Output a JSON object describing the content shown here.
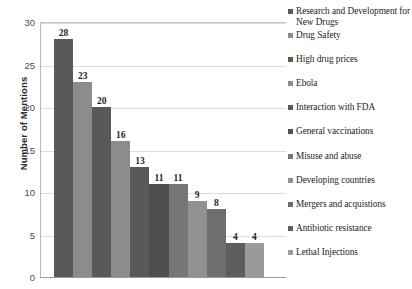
{
  "chart_data": {
    "type": "bar",
    "title": "",
    "xlabel": "",
    "ylabel": "Number of Mentions",
    "ylim": [
      0,
      30
    ],
    "ytick_labels": [
      "30",
      "25",
      "20",
      "15",
      "10",
      "5",
      "0"
    ],
    "ytick_values": [
      30,
      25,
      20,
      15,
      10,
      5,
      0
    ],
    "grid": true,
    "legend_position": "right",
    "categories": [
      "Research and Development for New Drugs",
      "Drug Safety",
      "High drug prices",
      "Ebola",
      "Interaction with FDA",
      "General vaccinations",
      "Misuse and abuse",
      "Developing countries",
      "Mergers and acquistions",
      "Antibiotic resistance",
      "Lethal Injections"
    ],
    "values": [
      28,
      23,
      20,
      16,
      13,
      11,
      11,
      9,
      8,
      4,
      4
    ],
    "data_labels": [
      "28",
      "23",
      "20",
      "16",
      "13",
      "11",
      "11",
      "9",
      "8",
      "4",
      "4"
    ],
    "colors": [
      "#595959",
      "#8c8c8c",
      "#595959",
      "#8c8c8c",
      "#595959",
      "#4f4f4f",
      "#767676",
      "#919191",
      "#6e6e6e",
      "#5e5e5e",
      "#9a9a9a"
    ]
  },
  "legend": {
    "items": [
      {
        "label": "Research and Development for New Drugs",
        "color": "#595959"
      },
      {
        "label": "Drug Safety",
        "color": "#8c8c8c"
      },
      {
        "label": "High drug prices",
        "color": "#595959"
      },
      {
        "label": "Ebola",
        "color": "#8c8c8c"
      },
      {
        "label": "Interaction with FDA",
        "color": "#595959"
      },
      {
        "label": "General vaccinations",
        "color": "#4f4f4f"
      },
      {
        "label": "Misuse and abuse",
        "color": "#767676"
      },
      {
        "label": "Developing countries",
        "color": "#919191"
      },
      {
        "label": "Mergers and acquistions",
        "color": "#6e6e6e"
      },
      {
        "label": "Antibiotic resistance",
        "color": "#5e5e5e"
      },
      {
        "label": "Lethal Injections",
        "color": "#9a9a9a"
      }
    ]
  }
}
